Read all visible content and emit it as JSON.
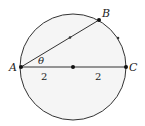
{
  "diagram": {
    "type": "geometry",
    "colors": {
      "stroke": "#333333",
      "fill": "#f5f5f5",
      "text": "#222222"
    },
    "points": {
      "A": {
        "label": "A"
      },
      "B": {
        "label": "B"
      },
      "C": {
        "label": "C"
      },
      "center": {
        "label": ""
      }
    },
    "angle_label": "θ",
    "segment_labels": {
      "left_radius": "2",
      "right_radius": "2"
    }
  }
}
